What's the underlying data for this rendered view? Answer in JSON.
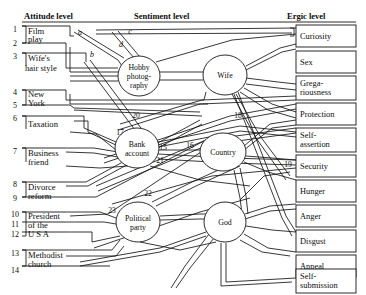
{
  "figure": {
    "kind": "dynamic-lattice-diagram",
    "width": 366,
    "height": 295,
    "background": "#ffffff",
    "ink": "#141414"
  },
  "columns": {
    "attitude": {
      "header": "Attitude level"
    },
    "sentiment": {
      "header": "Sentiment level"
    },
    "ergic": {
      "header": "Ergic level"
    }
  },
  "attitudes": [
    {
      "number": "1",
      "label_lines": [
        "Film",
        "play"
      ],
      "y": 30,
      "grouped": true
    },
    {
      "number": "2",
      "label_lines": [],
      "y": 44,
      "grouped": true
    },
    {
      "number": "3",
      "label_lines": [
        "Wife's",
        "hair style"
      ],
      "y": 57,
      "grouped": false
    },
    {
      "number": "4",
      "label_lines": [
        "New",
        "York"
      ],
      "y": 93,
      "grouped": true
    },
    {
      "number": "5",
      "label_lines": [],
      "y": 106,
      "grouped": true
    },
    {
      "number": "6",
      "label_lines": [
        "Taxation"
      ],
      "y": 119,
      "grouped": false
    },
    {
      "number": "7",
      "label_lines": [
        "Business",
        "friend"
      ],
      "y": 152,
      "grouped": false
    },
    {
      "number": "8",
      "label_lines": [
        "Divorce",
        "reform"
      ],
      "y": 185,
      "grouped": true
    },
    {
      "number": "9",
      "label_lines": [],
      "y": 199,
      "grouped": true
    },
    {
      "number": "10",
      "label_lines": [
        "President"
      ],
      "y": 215,
      "grouped": true
    },
    {
      "number": "11",
      "label_lines": [
        "of the"
      ],
      "y": 225,
      "grouped": true
    },
    {
      "number": "12",
      "label_lines": [
        "U S A"
      ],
      "y": 235,
      "grouped": true
    },
    {
      "number": "13",
      "label_lines": [
        "Methodist",
        "church"
      ],
      "y": 254,
      "grouped": true
    },
    {
      "number": "14",
      "label_lines": [],
      "y": 271,
      "grouped": true
    }
  ],
  "attitude_texts": [
    {
      "lines": [
        "Film",
        "play"
      ],
      "x": 27,
      "y": 30
    },
    {
      "lines": [
        "Wife's",
        "hair style"
      ],
      "x": 27,
      "y": 57
    },
    {
      "lines": [
        "New",
        "York"
      ],
      "x": 27,
      "y": 93
    },
    {
      "lines": [
        "Taxation"
      ],
      "x": 27,
      "y": 123
    },
    {
      "lines": [
        "Business",
        "friend"
      ],
      "x": 27,
      "y": 152
    },
    {
      "lines": [
        "Divorce",
        "reform"
      ],
      "x": 27,
      "y": 185
    },
    {
      "lines": [
        "President",
        "of the",
        "U S A"
      ],
      "x": 27,
      "y": 215
    },
    {
      "lines": [
        "Methodist",
        "church"
      ],
      "x": 27,
      "y": 254
    }
  ],
  "sentiments": [
    {
      "id": "hobby-photography",
      "label_lines": [
        "Hobby",
        "photog-",
        "raphy"
      ],
      "cx": 139,
      "cy": 76,
      "rx": 21,
      "ry": 20
    },
    {
      "id": "wife",
      "label_lines": [
        "Wife"
      ],
      "cx": 225,
      "cy": 75,
      "rx": 22,
      "ry": 20
    },
    {
      "id": "bank-account",
      "label_lines": [
        "Bank",
        "account"
      ],
      "cx": 137,
      "cy": 148,
      "rx": 22,
      "ry": 20
    },
    {
      "id": "country",
      "label_lines": [
        "Country"
      ],
      "cx": 223,
      "cy": 152,
      "rx": 23,
      "ry": 19
    },
    {
      "id": "political-party",
      "label_lines": [
        "Political",
        "party"
      ],
      "cx": 138,
      "cy": 222,
      "rx": 22,
      "ry": 20
    },
    {
      "id": "god",
      "label_lines": [
        "God"
      ],
      "cx": 225,
      "cy": 222,
      "rx": 21,
      "ry": 20
    }
  ],
  "ergic_goals": [
    {
      "index": 1,
      "label_lines": [
        "Curiosity"
      ],
      "y": 27
    },
    {
      "index": 2,
      "label_lines": [
        "Sex"
      ],
      "y": 56
    },
    {
      "index": 3,
      "label_lines": [
        "Grega-",
        "riousness"
      ],
      "y": 79
    },
    {
      "index": 4,
      "label_lines": [
        "Protection"
      ],
      "y": 106
    },
    {
      "index": 5,
      "label_lines": [
        "Self-",
        "assertion"
      ],
      "y": 128
    },
    {
      "index": 6,
      "label_lines": [
        "Security"
      ],
      "y": 155
    },
    {
      "index": 7,
      "label_lines": [
        "Hunger"
      ],
      "y": 177
    },
    {
      "index": 8,
      "label_lines": [
        "Anger"
      ],
      "y": 203
    },
    {
      "index": 9,
      "label_lines": [
        "Disgust"
      ],
      "y": 226
    },
    {
      "index": 10,
      "label_lines": [
        "Appeal"
      ],
      "y": 249
    },
    {
      "index": 11,
      "label_lines": [
        "Self-",
        "submission"
      ],
      "y": 271
    }
  ],
  "edge_tags_letters": [
    {
      "text": "a",
      "x": 80,
      "y": 35
    },
    {
      "text": "b",
      "x": 92,
      "y": 57
    },
    {
      "text": "c",
      "x": 130,
      "y": 34
    },
    {
      "text": "d",
      "x": 121,
      "y": 47
    }
  ],
  "edge_tags_numbers": [
    {
      "text": "15",
      "x": 163,
      "y": 150
    },
    {
      "text": "16",
      "x": 190,
      "y": 148
    },
    {
      "text": "17",
      "x": 120,
      "y": 135
    },
    {
      "text": "18",
      "x": 238,
      "y": 118
    },
    {
      "text": "19",
      "x": 288,
      "y": 167
    },
    {
      "text": "20",
      "x": 136,
      "y": 118
    },
    {
      "text": "21",
      "x": 160,
      "y": 163
    },
    {
      "text": "22",
      "x": 148,
      "y": 196
    },
    {
      "text": "23",
      "x": 112,
      "y": 213
    }
  ],
  "rules": [
    {
      "name": "attitude-header-rule",
      "x1": 22,
      "x2": 140,
      "y": 22
    },
    {
      "name": "sentiment-header-rule",
      "x1": 140,
      "x2": 296,
      "y": 22
    },
    {
      "name": "ergic-header-rule",
      "x1": 296,
      "x2": 356,
      "y": 22
    }
  ],
  "headers_pos": {
    "attitude": {
      "x": 24,
      "y": 19
    },
    "sentiment": {
      "x": 134,
      "y": 19
    },
    "ergic": {
      "x": 287,
      "y": 19
    }
  }
}
